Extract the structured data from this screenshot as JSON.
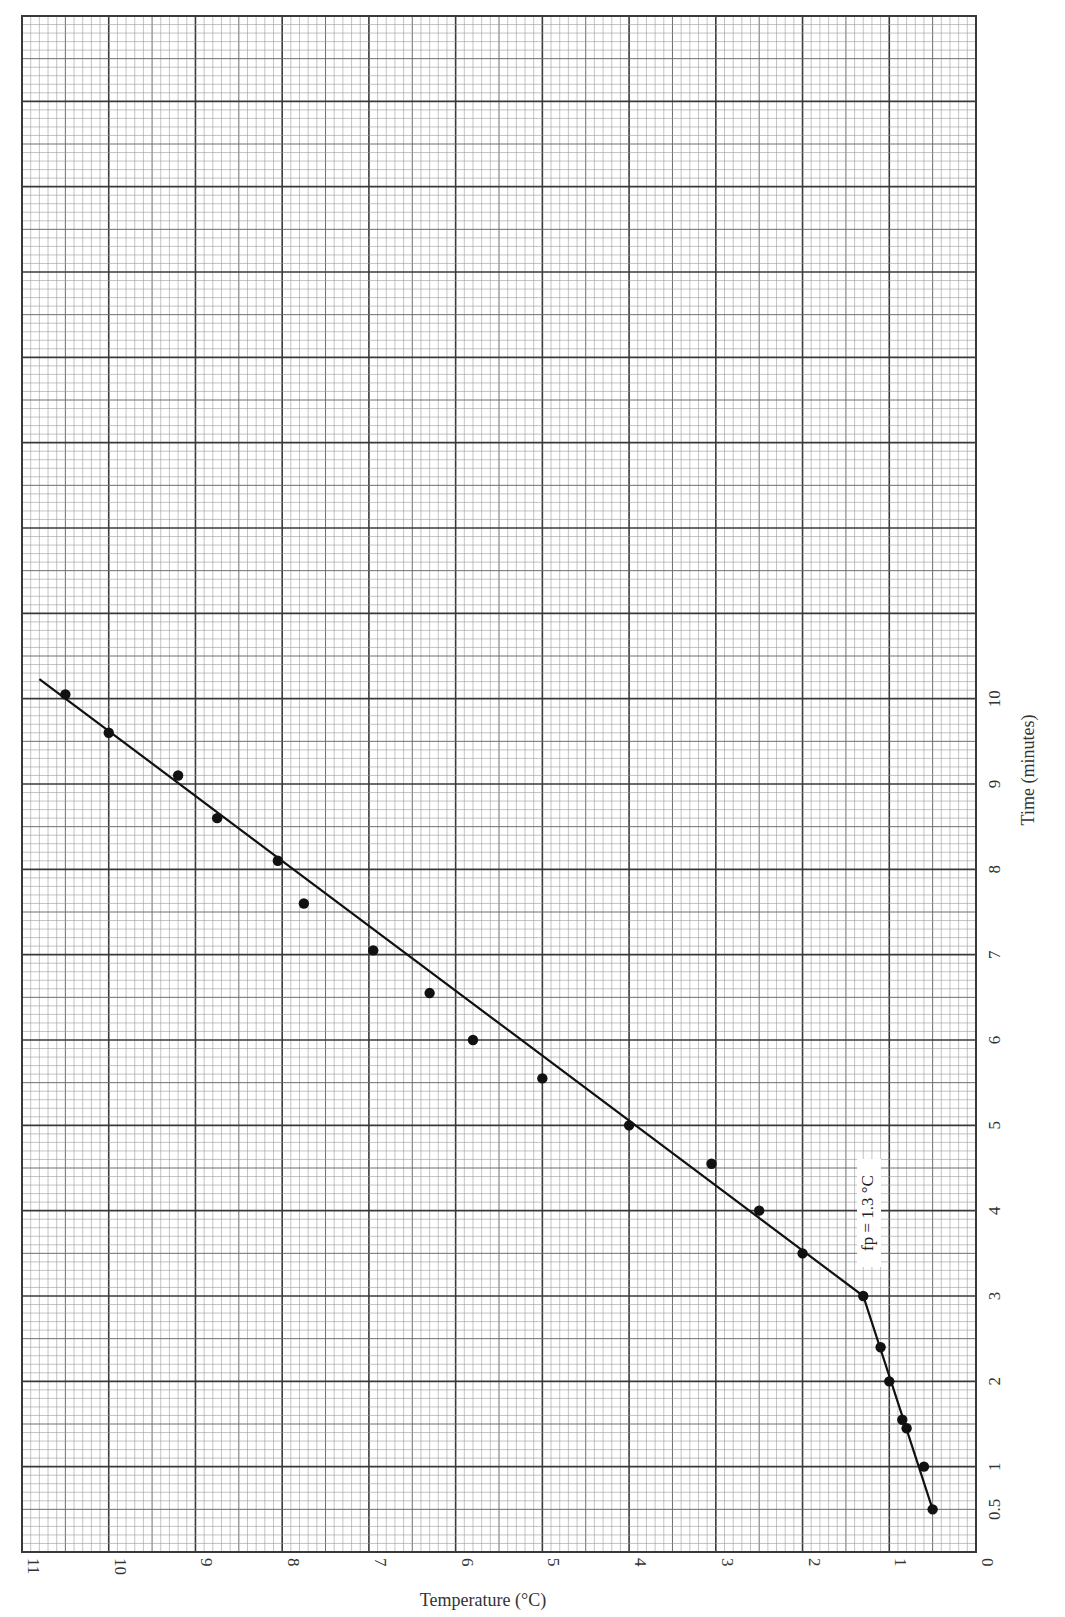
{
  "chart_data": {
    "type": "scatter",
    "title": "",
    "xlabel": "Temperature (°C)",
    "ylabel": "Time (minutes)",
    "orientation": "rotated page: temperature axis runs along bottom from 11 (left) to 0 (right); time axis runs along right side from 0 (bottom) to 10 (upwards)",
    "xlim": [
      0,
      11
    ],
    "ylim": [
      0,
      18
    ],
    "x_ticks": [
      "11",
      "10",
      "9",
      "8",
      "7",
      "6",
      "5",
      "4",
      "3",
      "2",
      "1",
      "0"
    ],
    "y_ticks": [
      "0.5",
      "1",
      "2",
      "3",
      "4",
      "5",
      "6",
      "7",
      "8",
      "9",
      "10"
    ],
    "grid": true,
    "legend": null,
    "series": [
      {
        "name": "Measurements",
        "marker": "filled-circle",
        "points": [
          {
            "temp": 0.5,
            "time": 0.5
          },
          {
            "temp": 0.6,
            "time": 1.0
          },
          {
            "temp": 0.8,
            "time": 1.45
          },
          {
            "temp": 0.85,
            "time": 1.55
          },
          {
            "temp": 1.0,
            "time": 2.0
          },
          {
            "temp": 1.1,
            "time": 2.4
          },
          {
            "temp": 1.3,
            "time": 3.0
          },
          {
            "temp": 2.0,
            "time": 3.5
          },
          {
            "temp": 2.5,
            "time": 4.0
          },
          {
            "temp": 3.05,
            "time": 4.55
          },
          {
            "temp": 4.0,
            "time": 5.0
          },
          {
            "temp": 5.0,
            "time": 5.55
          },
          {
            "temp": 5.8,
            "time": 6.0
          },
          {
            "temp": 6.3,
            "time": 6.55
          },
          {
            "temp": 6.95,
            "time": 7.05
          },
          {
            "temp": 7.75,
            "time": 7.6
          },
          {
            "temp": 8.05,
            "time": 8.1
          },
          {
            "temp": 8.75,
            "time": 8.6
          },
          {
            "temp": 9.2,
            "time": 9.1
          },
          {
            "temp": 10.0,
            "time": 9.6
          },
          {
            "temp": 10.5,
            "time": 10.05
          }
        ]
      },
      {
        "name": "Fitted lines",
        "type": "line",
        "points": [
          {
            "temp": 0.5,
            "time": 0.5
          },
          {
            "temp": 1.3,
            "time": 3.0
          },
          {
            "temp": 10.8,
            "time": 10.23
          }
        ]
      }
    ],
    "annotations": [
      {
        "text": "fp = 1.3 °C",
        "temp": 1.25,
        "time": 4.0,
        "rotation": -90
      }
    ]
  },
  "labels": {
    "x_axis_title": "Temperature (°C)",
    "y_axis_title": "Time (minutes)",
    "annotation": "fp = 1.3 °C"
  },
  "colors": {
    "background": "#ffffff",
    "minor_grid": "#9a9a9a",
    "mid_grid": "#6e6e6e",
    "major_grid": "#3a3a3a",
    "data": "#111111"
  }
}
